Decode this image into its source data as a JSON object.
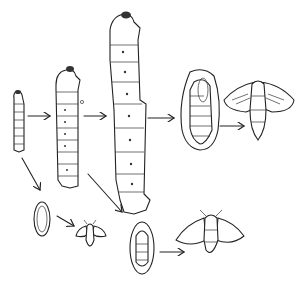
{
  "illustration": {
    "subject": "silkworm life cycle line drawing",
    "stroke_color": "#222222",
    "background": "#ffffff",
    "stages": [
      {
        "id": "larva-small",
        "kind": "caterpillar"
      },
      {
        "id": "larva-medium",
        "kind": "caterpillar"
      },
      {
        "id": "larva-large",
        "kind": "caterpillar"
      },
      {
        "id": "cocoon-large",
        "kind": "cocoon"
      },
      {
        "id": "moth-large",
        "kind": "moth"
      },
      {
        "id": "cocoon-small",
        "kind": "cocoon"
      },
      {
        "id": "moth-small",
        "kind": "moth"
      },
      {
        "id": "cocoon-medium",
        "kind": "cocoon"
      },
      {
        "id": "moth-medium",
        "kind": "moth"
      }
    ],
    "arrows": 8
  }
}
